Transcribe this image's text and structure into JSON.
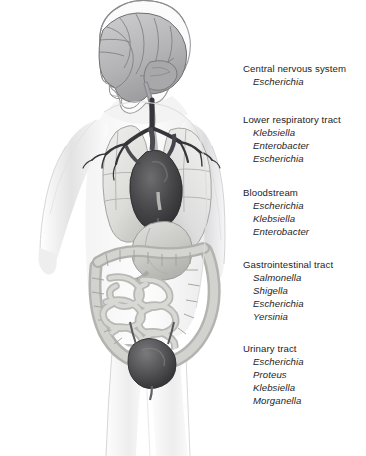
{
  "figure": {
    "background_color": "#ffffff",
    "ink_color": "#1d1d1d"
  },
  "anatomy": {
    "parts": [
      {
        "name": "body-silhouette",
        "tone": "#e9e9ea"
      },
      {
        "name": "head-profile",
        "tone": "#f2f2f2"
      },
      {
        "name": "brain",
        "tone": "#b9b9bb"
      },
      {
        "name": "brainstem-spinal-cord",
        "tone": "#9a9a9c"
      },
      {
        "name": "trachea-bronchi",
        "tone": "#3a3a3c"
      },
      {
        "name": "left-lung",
        "tone": "#e2e2e0"
      },
      {
        "name": "right-lung",
        "tone": "#e6e6e4"
      },
      {
        "name": "heart",
        "tone": "#4a4a4c"
      },
      {
        "name": "great-vessels",
        "tone": "#6a6a6c"
      },
      {
        "name": "stomach",
        "tone": "#cfcfcd"
      },
      {
        "name": "colon",
        "tone": "#c5c5c3"
      },
      {
        "name": "small-intestine",
        "tone": "#cdcdcb"
      },
      {
        "name": "bladder",
        "tone": "#585859"
      },
      {
        "name": "urethra",
        "tone": "#6a6a6c"
      }
    ]
  },
  "labels": {
    "blocks": [
      {
        "id": "cns",
        "site": "Central nervous system",
        "organisms": [
          "Escherichia"
        ]
      },
      {
        "id": "lrt",
        "site": "Lower respiratory tract",
        "organisms": [
          "Klebsiella",
          "Enterobacter",
          "Escherichia"
        ]
      },
      {
        "id": "blood",
        "site": "Bloodstream",
        "organisms": [
          "Escherichia",
          "Klebsiella",
          "Enterobacter"
        ]
      },
      {
        "id": "gi",
        "site": "Gastrointestinal tract",
        "organisms": [
          "Salmonella",
          "Shigella",
          "Escherichia",
          "Yersinia"
        ]
      },
      {
        "id": "uri",
        "site": "Urinary tract",
        "organisms": [
          "Escherichia",
          "Proteus",
          "Klebsiella",
          "Morganella"
        ]
      }
    ]
  }
}
